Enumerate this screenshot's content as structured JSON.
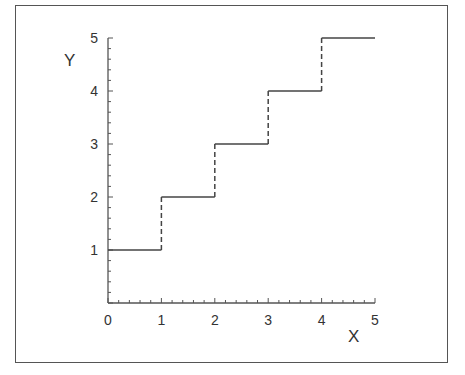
{
  "chart_data": {
    "type": "line",
    "subtype": "step",
    "title": "",
    "xlabel": "X",
    "ylabel": "Y",
    "xlim": [
      0,
      5
    ],
    "ylim": [
      0,
      5
    ],
    "xticks": [
      "0",
      "1",
      "2",
      "3",
      "4",
      "5"
    ],
    "yticks": [
      "1",
      "2",
      "3",
      "4",
      "5"
    ],
    "minor_ticks_per_interval": 4,
    "grid": false,
    "legend": null,
    "series": [
      {
        "name": "step function",
        "horizontal_segments": [
          {
            "x0": 0,
            "x1": 1,
            "y": 1
          },
          {
            "x0": 1,
            "x1": 2,
            "y": 2
          },
          {
            "x0": 2,
            "x1": 3,
            "y": 3
          },
          {
            "x0": 3,
            "x1": 4,
            "y": 4
          },
          {
            "x0": 4,
            "x1": 5,
            "y": 5
          }
        ],
        "vertical_jumps_dashed": [
          {
            "x": 1,
            "y0": 1,
            "y1": 2
          },
          {
            "x": 2,
            "y0": 2,
            "y1": 3
          },
          {
            "x": 3,
            "y0": 3,
            "y1": 4
          },
          {
            "x": 4,
            "y0": 4,
            "y1": 5
          }
        ]
      }
    ]
  },
  "colors": {
    "line": "#444444",
    "axis": "#555555",
    "frame": "#555555",
    "text": "#333333"
  }
}
